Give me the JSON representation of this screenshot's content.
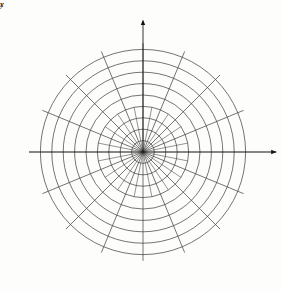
{
  "figure": {
    "name": "polar-coordinate-grid-with-cardioid",
    "background_color": "#fdfdfb",
    "grid_color": "#3a3a3a",
    "curve_color": "#000000",
    "axis_color": "#1a1a1a"
  },
  "axes": {
    "x_label": "x",
    "y_label": "y"
  },
  "angle_labels": [
    {
      "id": "theta-0",
      "theta_text": "θ",
      "eq": "=",
      "value_text": "0",
      "numerator": "",
      "denominator": "",
      "degrees": 0
    },
    {
      "id": "theta-pi-4",
      "theta_text": "θ",
      "eq": "=",
      "value_text": "",
      "numerator": "π",
      "denominator": "4",
      "degrees": 45
    },
    {
      "id": "theta-pi-2",
      "theta_text": "θ",
      "eq": "=",
      "value_text": "",
      "numerator": "π",
      "denominator": "2",
      "degrees": 90
    },
    {
      "id": "theta-3pi-4",
      "theta_text": "θ",
      "eq": "=",
      "value_text": "",
      "numerator": "3π",
      "denominator": "4",
      "degrees": 135
    },
    {
      "id": "theta-pi",
      "theta_text": "θ",
      "eq": "=",
      "value_text": "π",
      "numerator": "",
      "denominator": "",
      "degrees": 180
    },
    {
      "id": "theta-5pi-4",
      "theta_text": "θ",
      "eq": "=",
      "value_text": "",
      "numerator": "5π",
      "denominator": "4",
      "degrees": 225
    },
    {
      "id": "theta-3pi-2",
      "theta_text": "θ",
      "eq": "=",
      "value_text": "",
      "numerator": "3π",
      "denominator": "2",
      "degrees": 270
    },
    {
      "id": "theta-7pi-4",
      "theta_text": "θ",
      "eq": "=",
      "value_text": "",
      "numerator": "7π",
      "denominator": "4",
      "degrees": 315
    }
  ],
  "radial_ticks": [
    {
      "label": "4",
      "value": 4
    },
    {
      "label": "6",
      "value": 6
    },
    {
      "label": "8",
      "value": 8
    }
  ],
  "chart_data": {
    "type": "line",
    "subtype": "polar",
    "title": "",
    "xlabel": "x",
    "ylabel": "y",
    "grid": true,
    "legend": "none",
    "coordinate_system": "polar",
    "polar_grid": {
      "radial_circles": [
        1,
        2,
        3,
        4,
        5,
        6,
        7,
        8,
        9
      ],
      "radial_max": 9,
      "labeled_radii": [
        4,
        6,
        8
      ],
      "angular_spokes_degrees": [
        0,
        22.5,
        45,
        67.5,
        90,
        112.5,
        135,
        157.5,
        180,
        202.5,
        225,
        247.5,
        270,
        292.5,
        315,
        337.5
      ],
      "inner_spokes_degrees": [
        0,
        11.25,
        22.5,
        33.75,
        45,
        56.25,
        67.5,
        78.75,
        90,
        101.25,
        112.5,
        123.75,
        135,
        146.25,
        157.5,
        168.75,
        180,
        191.25,
        202.5,
        213.75,
        225,
        236.25,
        247.5,
        258.75,
        270,
        281.25,
        292.5,
        303.75,
        315,
        326.25,
        337.5,
        348.75
      ],
      "inner_spoke_max_radius": 4
    },
    "curve": {
      "name": "cardioid",
      "equation": "r = 2(1 - sin θ)",
      "a": 2,
      "cusp_angle_degrees": 90,
      "cusp_r": 0,
      "max_r": 4,
      "max_r_angle_degrees": 270,
      "theta_degrees": [
        0,
        10,
        20,
        30,
        40,
        50,
        60,
        70,
        80,
        90,
        100,
        110,
        120,
        130,
        140,
        150,
        160,
        170,
        180,
        190,
        200,
        210,
        220,
        230,
        240,
        250,
        260,
        270,
        280,
        290,
        300,
        310,
        320,
        330,
        340,
        350,
        360
      ],
      "r_values": [
        2.0,
        1.65,
        1.32,
        1.0,
        0.71,
        0.47,
        0.27,
        0.12,
        0.03,
        0.0,
        0.03,
        0.12,
        0.27,
        0.47,
        0.71,
        1.0,
        1.32,
        1.65,
        2.0,
        2.35,
        2.68,
        3.0,
        3.29,
        3.53,
        3.73,
        3.88,
        3.97,
        4.0,
        3.97,
        3.88,
        3.73,
        3.53,
        3.29,
        3.0,
        2.68,
        2.35,
        2.0
      ]
    }
  }
}
